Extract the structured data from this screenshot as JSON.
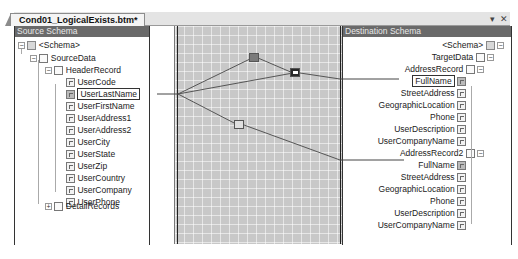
{
  "document_tab": {
    "title": "Cond01_LogicalExists.btm*"
  },
  "window_controls": {
    "dropdown_glyph": "▾",
    "close_glyph": "✕"
  },
  "source_schema": {
    "header": "Source Schema",
    "nodes": [
      {
        "label": "<Schema>",
        "icon": "folder-icon",
        "expander": "−",
        "level": 0
      },
      {
        "label": "SourceData",
        "icon": "document-icon",
        "expander": "−",
        "level": 1
      },
      {
        "label": "HeaderRecord",
        "icon": "record-icon",
        "expander": "−",
        "level": 2
      },
      {
        "label": "UserCode",
        "icon": "field-icon",
        "level": 3
      },
      {
        "label": "UserLastName",
        "icon": "linked-field-icon",
        "level": 3,
        "selected": true
      },
      {
        "label": "UserFirstName",
        "icon": "field-icon",
        "level": 3
      },
      {
        "label": "UserAddress1",
        "icon": "field-icon",
        "level": 3
      },
      {
        "label": "UserAddress2",
        "icon": "field-icon",
        "level": 3
      },
      {
        "label": "UserCity",
        "icon": "field-icon",
        "level": 3
      },
      {
        "label": "UserState",
        "icon": "field-icon",
        "level": 3
      },
      {
        "label": "UserZip",
        "icon": "field-icon",
        "level": 3
      },
      {
        "label": "UserCountry",
        "icon": "field-icon",
        "level": 3
      },
      {
        "label": "UserCompany",
        "icon": "field-icon",
        "level": 3
      },
      {
        "label": "UserPhone",
        "icon": "field-icon",
        "level": 3
      },
      {
        "label": "DetailRecords",
        "icon": "record-icon",
        "expander": "+",
        "level": 2
      }
    ]
  },
  "destination_schema": {
    "header": "Destination Schema",
    "nodes": [
      {
        "label": "<Schema>",
        "icon": "folder-icon",
        "expander": "−"
      },
      {
        "label": "TargetData",
        "icon": "document-icon",
        "expander": "−"
      },
      {
        "label": "AddressRecord",
        "icon": "record-icon",
        "expander": "−"
      },
      {
        "label": "FullName",
        "icon": "linked-field-icon",
        "selected": true
      },
      {
        "label": "StreetAddress",
        "icon": "field-icon"
      },
      {
        "label": "GeographicLocation",
        "icon": "field-icon"
      },
      {
        "label": "Phone",
        "icon": "field-icon"
      },
      {
        "label": "UserDescription",
        "icon": "field-icon"
      },
      {
        "label": "UserCompanyName",
        "icon": "field-icon"
      },
      {
        "label": "AddressRecord2",
        "icon": "record-icon",
        "expander": "−"
      },
      {
        "label": "FullName",
        "icon": "linked-field-icon"
      },
      {
        "label": "StreetAddress",
        "icon": "field-icon"
      },
      {
        "label": "GeographicLocation",
        "icon": "field-icon"
      },
      {
        "label": "Phone",
        "icon": "field-icon"
      },
      {
        "label": "UserDescription",
        "icon": "field-icon"
      },
      {
        "label": "UserCompanyName",
        "icon": "field-icon"
      }
    ]
  },
  "mapping_grid": {
    "functoids": [
      {
        "name": "logical-existence-functoid",
        "glyph": "∃"
      },
      {
        "name": "value-mapping-functoid",
        "glyph": "➔"
      },
      {
        "name": "logical-existence-functoid-2",
        "glyph": "∃"
      }
    ]
  },
  "colors": {
    "panel_header_bg": "#6a6a6a",
    "grid_bg": "#c8c8c8",
    "link_line": "#555555"
  }
}
